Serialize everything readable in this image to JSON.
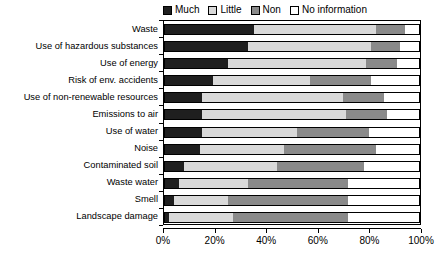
{
  "chart_data": {
    "type": "bar",
    "subtype": "horizontal-stacked-100pct",
    "title": "",
    "xlabel": "",
    "ylabel": "",
    "xlim": [
      0,
      100
    ],
    "xticks": [
      0,
      20,
      40,
      60,
      80,
      100
    ],
    "xtick_labels": [
      "0%",
      "20%",
      "40%",
      "60%",
      "80%",
      "100%"
    ],
    "grid": false,
    "legend_position": "top",
    "categories": [
      "Waste",
      "Use of hazardous substances",
      "Use of energy",
      "Risk of env. accidents",
      "Use of non-renewable resources",
      "Emissions to air",
      "Use of water",
      "Noise",
      "Contaminated soil",
      "Waste water",
      "Smell",
      "Landscape damage"
    ],
    "series": [
      {
        "name": "Much",
        "color": "#1f1f1f",
        "values": [
          35,
          33,
          25,
          19,
          15,
          15,
          15,
          14,
          8,
          6,
          4,
          2
        ]
      },
      {
        "name": "Little",
        "color": "#d9d9d9",
        "values": [
          48,
          48,
          54,
          38,
          55,
          56,
          37,
          33,
          36,
          27,
          21,
          25
        ]
      },
      {
        "name": "Non",
        "color": "#8a8a8a",
        "values": [
          11,
          11,
          12,
          24,
          16,
          16,
          28,
          36,
          34,
          39,
          47,
          45
        ]
      },
      {
        "name": "No information",
        "color": "#ffffff",
        "values": [
          6,
          8,
          9,
          19,
          14,
          13,
          20,
          17,
          22,
          28,
          28,
          28
        ]
      }
    ]
  },
  "legend": {
    "items": [
      {
        "label": "Much",
        "color": "#1f1f1f"
      },
      {
        "label": "Little",
        "color": "#d9d9d9"
      },
      {
        "label": "Non",
        "color": "#8a8a8a"
      },
      {
        "label": "No information",
        "color": "#ffffff"
      }
    ]
  }
}
